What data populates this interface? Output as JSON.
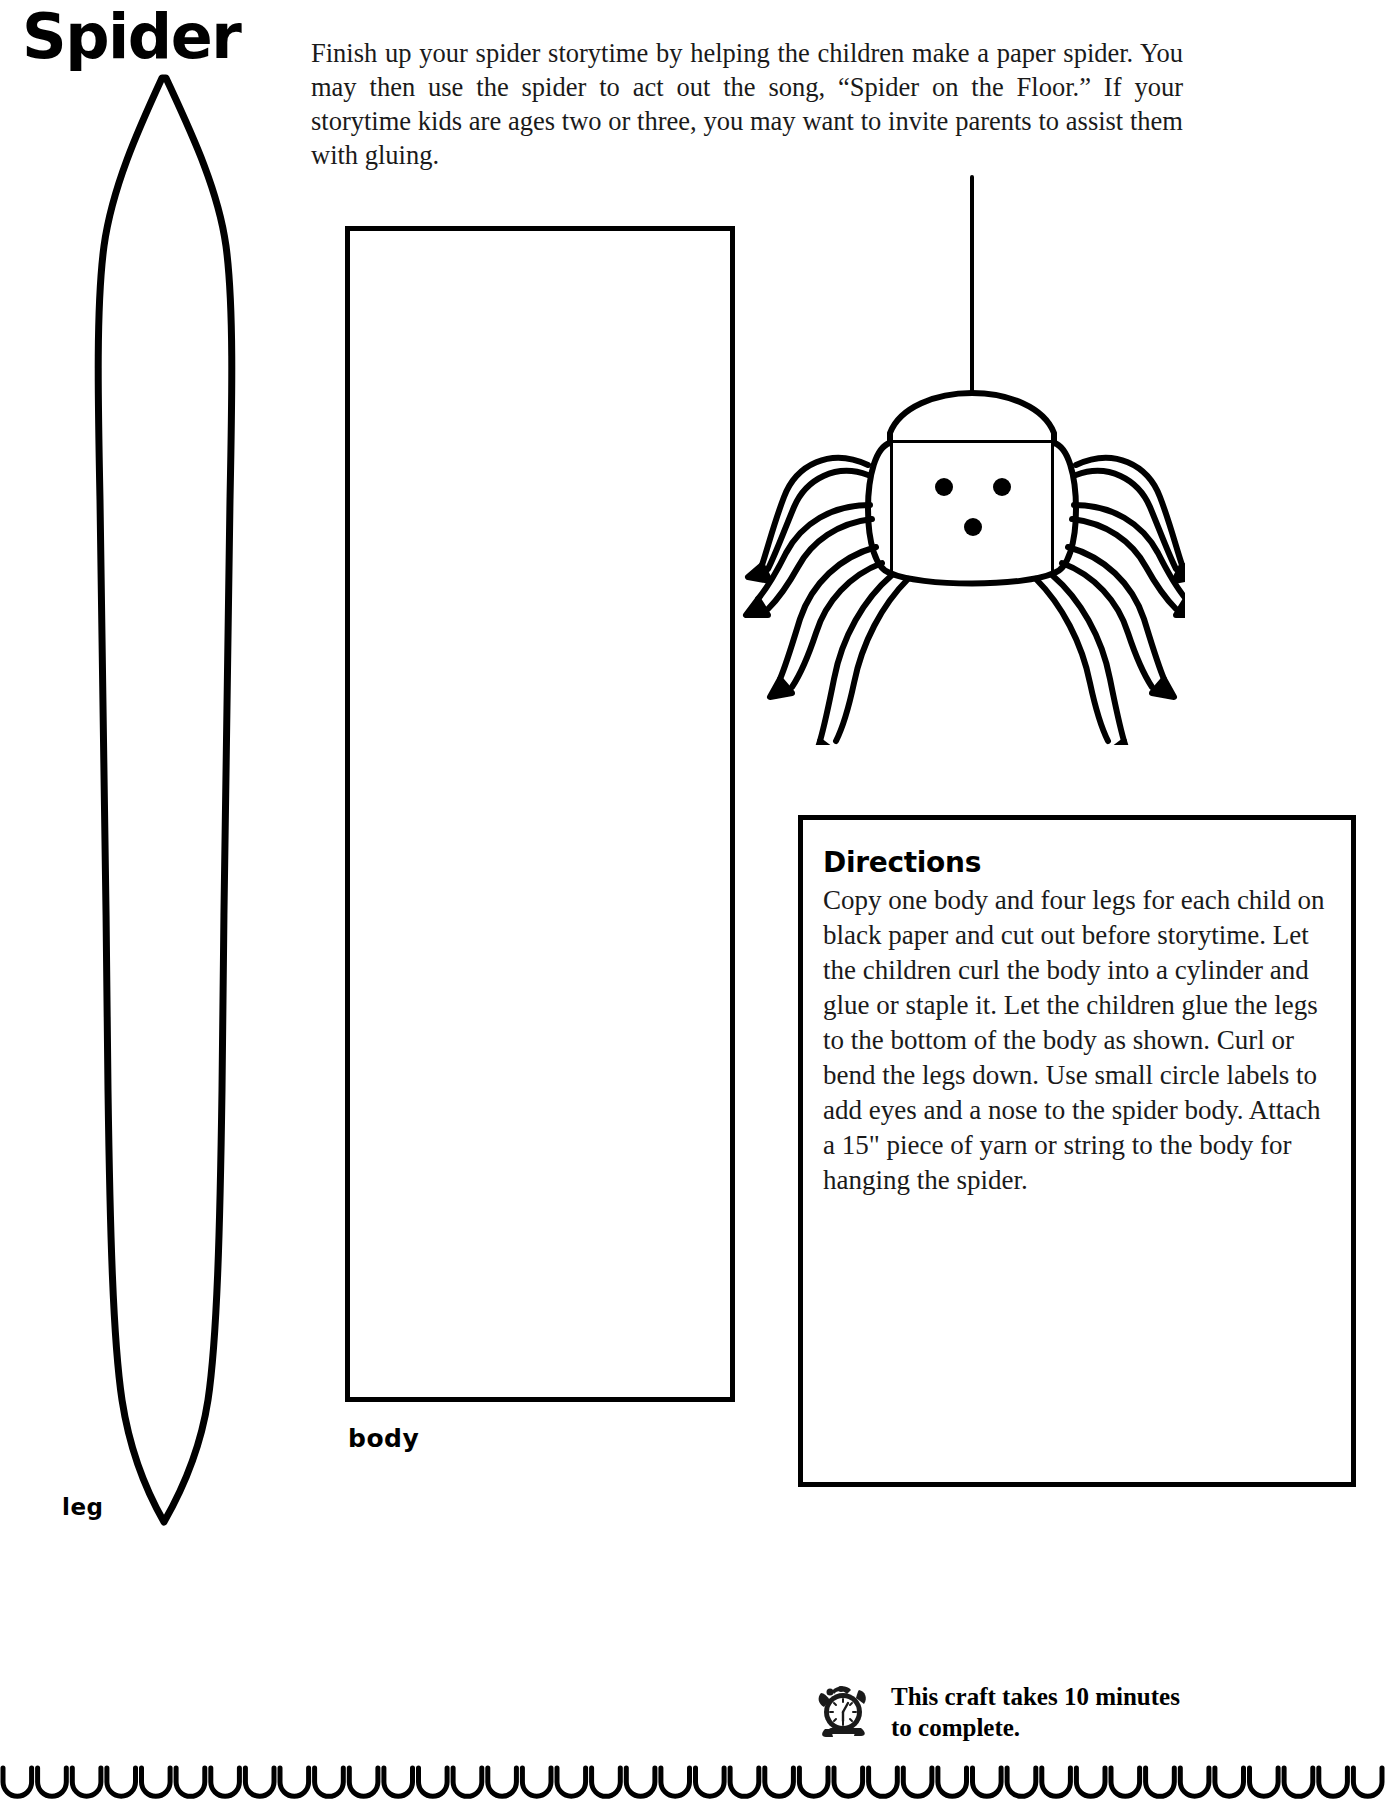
{
  "page": {
    "title": "Spider",
    "intro": "Finish up your spider storytime by helping the children make a paper spider. You may then use the spider to act out the song, “Spider on the Floor.” If your storytime kids are ages two or three, you may want to invite parents to assist them with gluing."
  },
  "templates": {
    "leg_label": "leg",
    "body_label": "body"
  },
  "illustration": {
    "name": "paper-spider-hanging-from-string",
    "eye_count": 2,
    "nose_count": 1,
    "leg_count": 8
  },
  "directions": {
    "heading": "Directions",
    "body": "Copy one body and four legs for each child on black paper and cut out before storytime. Let the children curl the body into a cylinder and glue or staple it. Let the children glue the legs to the bottom of the body as shown. Curl or bend the legs down. Use small circle labels to add eyes and a nose to the spider body. Attach a 15\" piece of yarn or string to the body for hanging the spider."
  },
  "footer": {
    "icon": "alarm-clock-icon",
    "note": "This craft takes 10 minutes to complete."
  },
  "decor": {
    "scallop_count": 40
  },
  "colors": {
    "ink": "#000000",
    "paper": "#ffffff",
    "body_text": "#1a1a1a"
  }
}
